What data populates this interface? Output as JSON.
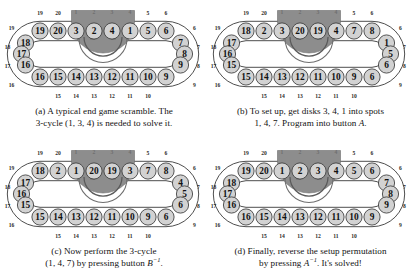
{
  "figure": {
    "colors": {
      "background": "#ffffff",
      "disk_fill": "#d2d2d2",
      "disk_stroke": "#3a3a3a",
      "track_stroke": "#2e2e2e",
      "turntable_fill": "#8d8d8d",
      "turntable_inner_fill": "#7a7a7a",
      "arrow_fill": "#5a5a5a",
      "text": "#111111"
    },
    "geometry": {
      "disk_count": 20,
      "turntable_positions": [
        1,
        2,
        3,
        4
      ]
    }
  },
  "panels": [
    {
      "id": "panel-a",
      "label": "(a)",
      "caption_line1": "(a) A typical end game scramble. The",
      "caption_line2_pre": "3-cycle (1, 3, 4) is needed to solve it.",
      "caption_line2_italic": "",
      "caption_line2_sup": "",
      "caption_line2_post": "",
      "top_disks": [
        19,
        20,
        3,
        2,
        4,
        1,
        5,
        6
      ],
      "left_disks": [
        18,
        17,
        16
      ],
      "right_disks": [
        7,
        8,
        9
      ],
      "bottom_disks": [
        15,
        14,
        13,
        12,
        11,
        10
      ],
      "top_pos_labels": [
        19,
        20,
        1,
        2,
        3,
        4,
        5,
        6
      ],
      "left_pos_labels": [
        18,
        17,
        16
      ],
      "right_pos_labels": [
        7,
        8,
        9
      ],
      "bottom_pos_labels": [
        15,
        14,
        13,
        12,
        11,
        10
      ]
    },
    {
      "id": "panel-b",
      "label": "(b)",
      "caption_line1": "(b) To set up, get disks 3, 4, 1 into spots",
      "caption_line2_pre": "1, 4, 7. Program into button ",
      "caption_line2_italic": "A",
      "caption_line2_sup": "",
      "caption_line2_post": ".",
      "top_disks": [
        18,
        2,
        3,
        20,
        19,
        4,
        7,
        8
      ],
      "left_disks": [
        17,
        16,
        15
      ],
      "right_disks": [
        1,
        5,
        6
      ],
      "bottom_disks": [
        14,
        13,
        12,
        11,
        10,
        9
      ],
      "top_pos_labels": [
        19,
        20,
        1,
        2,
        3,
        4,
        5,
        6
      ],
      "left_pos_labels": [
        18,
        17,
        16
      ],
      "right_pos_labels": [
        7,
        8,
        9
      ],
      "bottom_pos_labels": [
        15,
        14,
        13,
        12,
        11,
        10
      ]
    },
    {
      "id": "panel-c",
      "label": "(c)",
      "caption_line1": "(c) Now perform the 3-cycle",
      "caption_line2_pre": "(1, 4, 7) by pressing button ",
      "caption_line2_italic": "B",
      "caption_line2_sup": "-1",
      "caption_line2_post": ".",
      "top_disks": [
        18,
        2,
        1,
        20,
        19,
        3,
        7,
        8
      ],
      "left_disks": [
        17,
        16,
        15
      ],
      "right_disks": [
        4,
        5,
        6
      ],
      "bottom_disks": [
        14,
        13,
        12,
        11,
        10,
        9
      ],
      "top_pos_labels": [
        19,
        20,
        1,
        2,
        3,
        4,
        5,
        6
      ],
      "left_pos_labels": [
        18,
        17,
        16
      ],
      "right_pos_labels": [
        7,
        8,
        9
      ],
      "bottom_pos_labels": [
        15,
        14,
        13,
        12,
        11,
        10
      ]
    },
    {
      "id": "panel-d",
      "label": "(d)",
      "caption_line1": "(d) Finally, reverse the setup permutation",
      "caption_line2_pre": "by pressing ",
      "caption_line2_italic": "A",
      "caption_line2_sup": "-1",
      "caption_line2_post": ". It's solved!",
      "top_disks": [
        19,
        20,
        1,
        2,
        3,
        4,
        5,
        6
      ],
      "left_disks": [
        18,
        17,
        16
      ],
      "right_disks": [
        7,
        8,
        9
      ],
      "bottom_disks": [
        16,
        15,
        14,
        13,
        12,
        11,
        10,
        9
      ],
      "bottom_disks_actual": [
        15,
        14,
        13,
        12,
        11,
        10
      ],
      "top_pos_labels": [
        19,
        20,
        1,
        2,
        3,
        4,
        5,
        6
      ],
      "left_pos_labels": [
        18,
        17,
        16
      ],
      "right_pos_labels": [
        7,
        8,
        9
      ],
      "bottom_pos_labels": [
        15,
        14,
        13,
        12,
        11,
        10
      ]
    }
  ]
}
